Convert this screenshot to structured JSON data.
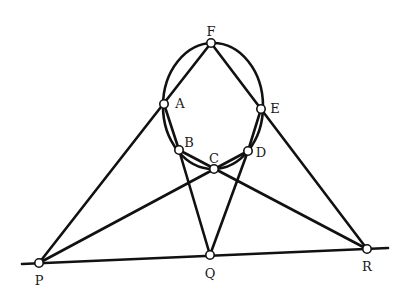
{
  "diagram": {
    "type": "projective-geometry-construction",
    "colors": {
      "stroke": "#111111",
      "point_fill": "#ffffff",
      "background": "#ffffff"
    },
    "conic": {
      "cx": 213,
      "cy": 106,
      "rx": 50,
      "ry": 63
    },
    "points": {
      "F": {
        "label": "F",
        "x": 211,
        "y": 43,
        "lx": 211,
        "ly": 32
      },
      "A": {
        "label": "A",
        "x": 164,
        "y": 104,
        "lx": 180,
        "ly": 104
      },
      "E": {
        "label": "E",
        "x": 261,
        "y": 109,
        "lx": 275,
        "ly": 109
      },
      "B": {
        "label": "B",
        "x": 179,
        "y": 150,
        "lx": 189,
        "ly": 143
      },
      "C": {
        "label": "C",
        "x": 214,
        "y": 169,
        "lx": 214,
        "ly": 159
      },
      "D": {
        "label": "D",
        "x": 248,
        "y": 151,
        "lx": 261,
        "ly": 153
      },
      "P": {
        "label": "P",
        "x": 39,
        "y": 263,
        "lx": 39,
        "ly": 281
      },
      "Q": {
        "label": "Q",
        "x": 210,
        "y": 255,
        "lx": 210,
        "ly": 274
      },
      "R": {
        "label": "R",
        "x": 367,
        "y": 249,
        "lx": 367,
        "ly": 267
      }
    },
    "lines": [
      {
        "name": "line-P-F",
        "from": "P",
        "to": "F"
      },
      {
        "name": "line-R-F",
        "from": "R",
        "to": "F"
      },
      {
        "name": "line-P-D",
        "from": "P",
        "to": "D"
      },
      {
        "name": "line-R-B",
        "from": "R",
        "to": "B"
      },
      {
        "name": "line-B-Q",
        "from": "B",
        "to": "Q"
      },
      {
        "name": "line-D-Q",
        "from": "D",
        "to": "Q"
      },
      {
        "name": "line-A-B",
        "from": "A",
        "to": "B"
      },
      {
        "name": "line-E-D",
        "from": "E",
        "to": "D"
      }
    ],
    "baseline": {
      "x1": 22,
      "y1": 264,
      "x2": 388,
      "y2": 248
    }
  }
}
